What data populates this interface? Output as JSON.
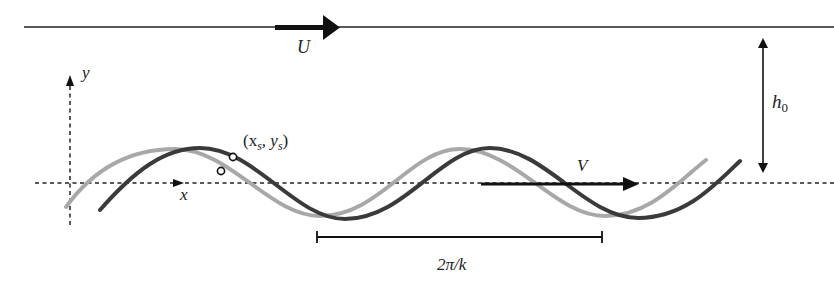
{
  "labels": {
    "top_velocity": "U",
    "height": "h",
    "height_sub": "0",
    "y_axis": "y",
    "x_axis": "x",
    "point": "(x",
    "point_xs_sub": "s",
    "point_mid": ", y",
    "point_ys_sub": "s",
    "point_close": ")",
    "wave_velocity": "V",
    "wavelength": "2π/k"
  },
  "colors": {
    "background": "#ffffff",
    "line": "#1a1a1a",
    "wave_current": "#3a3a3a",
    "wave_previous": "#a8a8a8"
  }
}
